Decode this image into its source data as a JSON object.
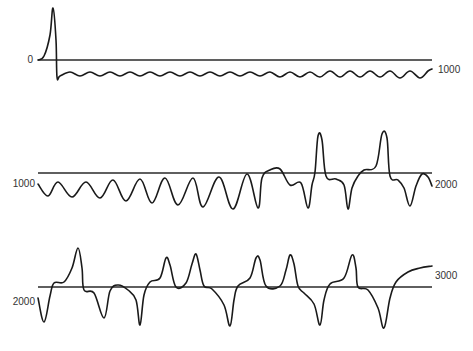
{
  "figure": {
    "panels": [
      {
        "left_label": "0",
        "right_label": "1000",
        "baseline_y": 60,
        "x_start": 38,
        "x_end": 432
      },
      {
        "left_label": "1000",
        "right_label": "2000",
        "baseline_y": 173,
        "x_start": 38,
        "x_end": 432
      },
      {
        "left_label": "2000",
        "right_label": "3000",
        "baseline_y": 287,
        "x_start": 38,
        "x_end": 432
      }
    ],
    "colors": {
      "trace": "#1a1a1a",
      "baseline": "#2a2a2a",
      "label": "#333333"
    }
  },
  "chart_data": [
    {
      "type": "line",
      "title": "",
      "xlabel": "",
      "ylabel": "",
      "x_range": [
        0,
        1000
      ],
      "start_label": "0",
      "end_label": "1000",
      "grid": false,
      "description": "Single large upward spike at start, then a sharp drop below baseline into a small, regular low-amplitude oscillation (~19 cycles) below the baseline",
      "series": [
        {
          "name": "trace-0-1000",
          "points": [
            [
              38,
              60
            ],
            [
              44,
              56
            ],
            [
              50,
              35
            ],
            [
              53,
              8
            ],
            [
              56,
              40
            ],
            [
              57,
              77
            ],
            [
              60,
              76
            ],
            [
              70,
              72
            ],
            [
              80,
              76
            ],
            [
              90,
              72
            ],
            [
              100,
              76
            ],
            [
              110,
              72
            ],
            [
              120,
              76
            ],
            [
              130,
              72
            ],
            [
              140,
              76
            ],
            [
              150,
              72
            ],
            [
              160,
              76
            ],
            [
              170,
              72
            ],
            [
              180,
              76
            ],
            [
              190,
              72
            ],
            [
              200,
              76
            ],
            [
              210,
              72
            ],
            [
              220,
              76
            ],
            [
              230,
              72
            ],
            [
              240,
              76
            ],
            [
              250,
              72
            ],
            [
              260,
              76
            ],
            [
              270,
              72
            ],
            [
              280,
              77
            ],
            [
              290,
              72
            ],
            [
              300,
              77
            ],
            [
              310,
              72
            ],
            [
              320,
              77
            ],
            [
              330,
              71
            ],
            [
              340,
              77
            ],
            [
              350,
              71
            ],
            [
              360,
              77
            ],
            [
              370,
              71
            ],
            [
              380,
              77
            ],
            [
              390,
              71
            ],
            [
              400,
              78
            ],
            [
              410,
              71
            ],
            [
              420,
              78
            ],
            [
              428,
              71
            ],
            [
              432,
              69
            ]
          ]
        }
      ]
    },
    {
      "type": "line",
      "title": "",
      "xlabel": "",
      "ylabel": "",
      "x_range": [
        1000,
        2000
      ],
      "start_label": "1000",
      "end_label": "2000",
      "grid": false,
      "description": "Oscillation below baseline with increasing amplitude, transitioning after ~x=262 into large biphasic complexes with peaks above baseline",
      "series": [
        {
          "name": "trace-1000-2000",
          "points": [
            [
              38,
              184
            ],
            [
              48,
              196
            ],
            [
              58,
              182
            ],
            [
              72,
              197
            ],
            [
              86,
              182
            ],
            [
              100,
              198
            ],
            [
              113,
              180
            ],
            [
              126,
              201
            ],
            [
              140,
              179
            ],
            [
              152,
              203
            ],
            [
              165,
              178
            ],
            [
              178,
              205
            ],
            [
              193,
              178
            ],
            [
              203,
              207
            ],
            [
              219,
              177
            ],
            [
              233,
              209
            ],
            [
              247,
              174
            ],
            [
              258,
              208
            ],
            [
              262,
              178
            ],
            [
              270,
              170
            ],
            [
              280,
              169
            ],
            [
              290,
              185
            ],
            [
              301,
              183
            ],
            [
              308,
              208
            ],
            [
              312,
              185
            ],
            [
              315,
              172
            ],
            [
              318,
              136
            ],
            [
              322,
              140
            ],
            [
              326,
              176
            ],
            [
              336,
              179
            ],
            [
              344,
              185
            ],
            [
              348,
              209
            ],
            [
              352,
              188
            ],
            [
              358,
              176
            ],
            [
              364,
              170
            ],
            [
              376,
              166
            ],
            [
              382,
              134
            ],
            [
              387,
              138
            ],
            [
              390,
              176
            ],
            [
              398,
              180
            ],
            [
              404,
              188
            ],
            [
              410,
              206
            ],
            [
              416,
              186
            ],
            [
              422,
              174
            ],
            [
              428,
              177
            ],
            [
              432,
              186
            ]
          ]
        }
      ]
    },
    {
      "type": "line",
      "title": "",
      "xlabel": "",
      "ylabel": "",
      "x_range": [
        2000,
        3000
      ],
      "start_label": "2000",
      "end_label": "3000",
      "grid": false,
      "description": "Repeating biphasic complexes: peaks above baseline followed by deep troughs below baseline",
      "series": [
        {
          "name": "trace-2000-3000",
          "points": [
            [
              38,
              298
            ],
            [
              44,
              322
            ],
            [
              50,
              296
            ],
            [
              54,
              283
            ],
            [
              64,
              282
            ],
            [
              72,
              268
            ],
            [
              78,
              248
            ],
            [
              82,
              268
            ],
            [
              84,
              290
            ],
            [
              94,
              293
            ],
            [
              104,
              318
            ],
            [
              110,
              291
            ],
            [
              118,
              285
            ],
            [
              128,
              290
            ],
            [
              136,
              300
            ],
            [
              140,
              325
            ],
            [
              144,
              295
            ],
            [
              150,
              282
            ],
            [
              160,
              278
            ],
            [
              166,
              258
            ],
            [
              170,
              265
            ],
            [
              176,
              287
            ],
            [
              186,
              283
            ],
            [
              192,
              264
            ],
            [
              196,
              254
            ],
            [
              200,
              270
            ],
            [
              204,
              286
            ],
            [
              212,
              289
            ],
            [
              224,
              305
            ],
            [
              230,
              326
            ],
            [
              234,
              300
            ],
            [
              238,
              286
            ],
            [
              250,
              278
            ],
            [
              256,
              258
            ],
            [
              260,
              260
            ],
            [
              266,
              286
            ],
            [
              280,
              286
            ],
            [
              286,
              270
            ],
            [
              290,
              255
            ],
            [
              294,
              264
            ],
            [
              298,
              286
            ],
            [
              304,
              293
            ],
            [
              314,
              304
            ],
            [
              320,
              325
            ],
            [
              324,
              300
            ],
            [
              330,
              284
            ],
            [
              344,
              278
            ],
            [
              352,
              255
            ],
            [
              356,
              268
            ],
            [
              358,
              287
            ],
            [
              368,
              290
            ],
            [
              378,
              308
            ],
            [
              384,
              328
            ],
            [
              390,
              298
            ],
            [
              396,
              282
            ],
            [
              408,
              272
            ],
            [
              420,
              268
            ],
            [
              432,
              266
            ]
          ]
        }
      ]
    }
  ]
}
